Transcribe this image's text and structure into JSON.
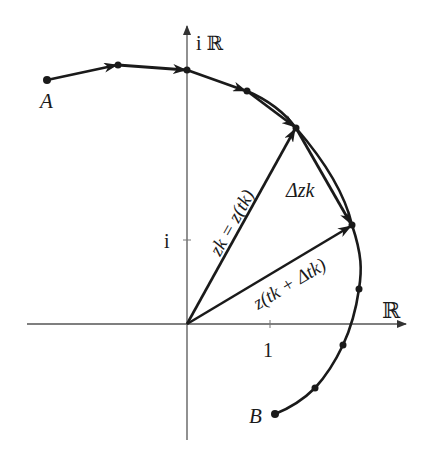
{
  "figure": {
    "axes": {
      "real_label": "ℝ",
      "imag_label": "i ℝ",
      "tick_real": "1",
      "tick_imag": "i"
    },
    "points": {
      "start_label": "A",
      "end_label": "B"
    },
    "vectors": {
      "zk_label": "zk = z(tk)",
      "zk_next_label": "z(tk + Δtk)",
      "delta_label": "Δzk"
    },
    "colors": {
      "ink": "#1a1a1a",
      "axis": "#555555",
      "background": "#ffffff"
    }
  }
}
